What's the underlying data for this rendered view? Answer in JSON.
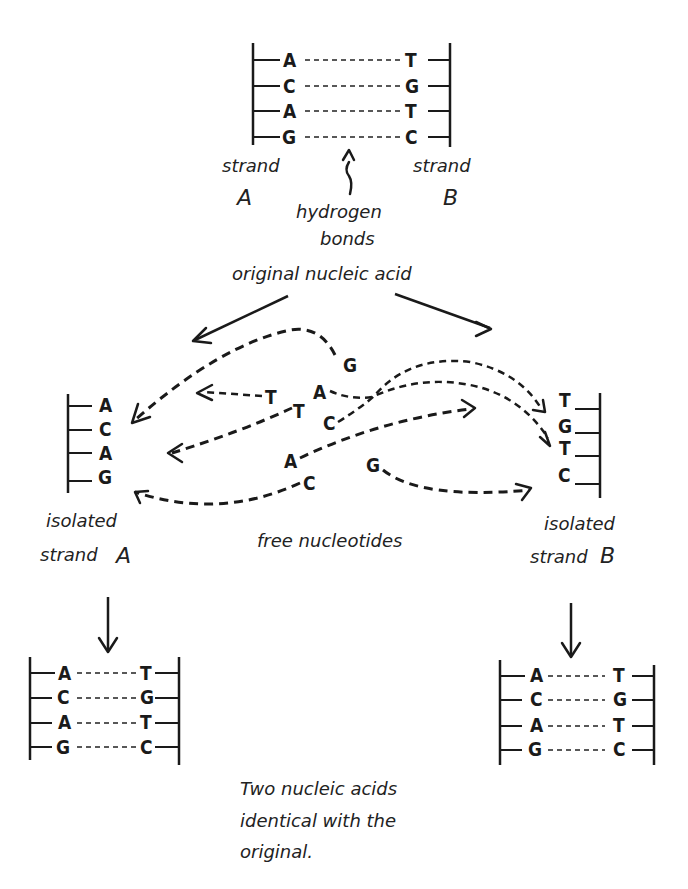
{
  "original": {
    "pairs": [
      {
        "left": "A",
        "right": "T"
      },
      {
        "left": "C",
        "right": "G"
      },
      {
        "left": "A",
        "right": "T"
      },
      {
        "left": "G",
        "right": "C"
      }
    ],
    "strand_a_label_1": "strand",
    "strand_a_label_2": "A",
    "strand_b_label_1": "strand",
    "strand_b_label_2": "B",
    "hydrogen_label_1": "hydrogen",
    "hydrogen_label_2": "bonds",
    "title": "original nucleic acid"
  },
  "isolated_a": {
    "bases": [
      "A",
      "C",
      "A",
      "G"
    ],
    "label_1": "isolated",
    "label_2": "strand",
    "label_3": "A"
  },
  "isolated_b": {
    "bases": [
      "T",
      "G",
      "T",
      "C"
    ],
    "label_1": "isolated",
    "label_2": "strand",
    "label_3": "B"
  },
  "free_nucleotides": {
    "label": "free nucleotides",
    "items": [
      "G",
      "T",
      "T",
      "A",
      "C",
      "A",
      "C",
      "G"
    ]
  },
  "result_left": {
    "pairs": [
      {
        "left": "A",
        "right": "T"
      },
      {
        "left": "C",
        "right": "G"
      },
      {
        "left": "A",
        "right": "T"
      },
      {
        "left": "G",
        "right": "C"
      }
    ]
  },
  "result_right": {
    "pairs": [
      {
        "left": "A",
        "right": "T"
      },
      {
        "left": "C",
        "right": "G"
      },
      {
        "left": "A",
        "right": "T"
      },
      {
        "left": "G",
        "right": "C"
      }
    ]
  },
  "caption": {
    "line_1": "Two nucleic acids",
    "line_2": "identical with the",
    "line_3": "original."
  }
}
